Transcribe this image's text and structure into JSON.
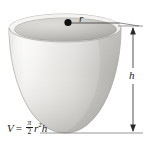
{
  "figure": {
    "background_color": "#ffffff",
    "labels": {
      "radius": "r",
      "height": "h"
    },
    "formula": {
      "lhs": "V",
      "equals": "=",
      "fraction_numerator": "π",
      "fraction_denominator": "2",
      "radius_variable": "r",
      "radius_exponent": "2",
      "height_variable": "h",
      "plain_text": "V = (π/2) r²h"
    },
    "colors": {
      "solid_light": "#f2f1ef",
      "solid_mid": "#d8d6d3",
      "solid_shadow": "#b4b2af",
      "rim_inner": "#bfbdba",
      "rim_inner_dark": "#a8a6a3",
      "outline": "#9a9895",
      "dimension_line": "#4a4a4a",
      "center_dot": "#111111",
      "text": "#1a1a1a"
    },
    "geometry": {
      "top_rim_center_x": 65,
      "top_rim_center_y": 28,
      "top_rim_radius_x": 56,
      "top_rim_radius_y": 14,
      "bottom_tip_y": 133,
      "dimension_line_x": 133,
      "dimension_top_y": 26,
      "dimension_bottom_y": 133
    }
  }
}
